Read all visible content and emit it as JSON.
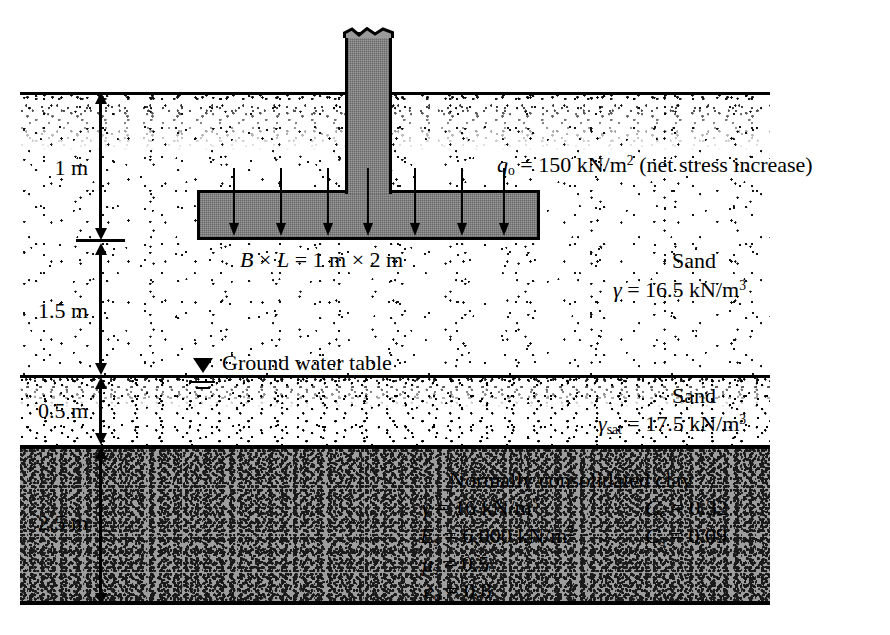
{
  "diagram": {
    "surcharge_label_parts": {
      "symbol": "q",
      "sub": "o",
      "eq": "=",
      "value": "150 kN/m",
      "exp": "2",
      "note": "(net stress increase)"
    },
    "footing_label": {
      "b": "B",
      "times1": "×",
      "l": "L",
      "eq": "=",
      "value": "1 m × 2 m"
    },
    "depth_dimensions": [
      {
        "name": "embedment-depth",
        "label": "1 m"
      },
      {
        "name": "sand-above-gwt",
        "label": "1.5 m"
      },
      {
        "name": "saturated-sand",
        "label": "0.5 m"
      },
      {
        "name": "clay-thickness",
        "label": "2.5 m"
      }
    ],
    "water_table": {
      "label": "Ground water table"
    },
    "layers": [
      {
        "name": "sand-upper",
        "title": "Sand",
        "props": [
          {
            "symbol": "γ",
            "sub": "",
            "eq": "=",
            "value": "16.5 kN/m",
            "exp": "3"
          }
        ]
      },
      {
        "name": "sand-saturated",
        "title": "Sand",
        "props": [
          {
            "symbol": "γ",
            "sub": "sat",
            "eq": "=",
            "value": "17.5 kN/m",
            "exp": "3"
          }
        ]
      },
      {
        "name": "clay",
        "title": "Normally consolidated clay",
        "props_left": [
          {
            "symbol": "γ",
            "sub": "",
            "eq": "=",
            "value": "16 kN/m",
            "exp": "3"
          },
          {
            "symbol": "E",
            "sub": "s",
            "eq": "=",
            "value": "6,000 kN/m",
            "exp": "2"
          },
          {
            "symbol": "μ",
            "sub": "s",
            "eq": "=",
            "value": "0.5",
            "exp": ""
          },
          {
            "symbol": "e",
            "sub": "o",
            "eq": "=",
            "value": "0.8",
            "exp": ""
          }
        ],
        "props_right": [
          {
            "symbol": "C",
            "sub": "c",
            "eq": "=",
            "value": "0.32",
            "exp": ""
          },
          {
            "symbol": "C",
            "sub": "s",
            "eq": "=",
            "value": "0.09",
            "exp": ""
          }
        ]
      }
    ],
    "load_arrow_count": 7,
    "colors": {
      "concrete_fill": "#9a9a9a",
      "clay_fill": "#9d9d9d",
      "sand_fill": "#ffffff",
      "line": "#000000"
    }
  }
}
